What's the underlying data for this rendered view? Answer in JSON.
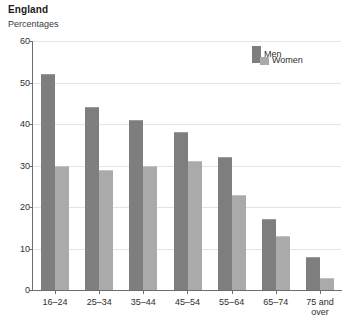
{
  "header": {
    "title": "England",
    "subtitle": "Percentages"
  },
  "legend": {
    "position": "top-right",
    "entries": [
      {
        "label": "Men",
        "color": "#7e7e7e"
      },
      {
        "label": "Women",
        "color": "#aaaaaa"
      }
    ]
  },
  "axes": {
    "y_ticks": [
      "0",
      "10",
      "20",
      "30",
      "40",
      "50",
      "60"
    ],
    "x_ticks": [
      "16–24",
      "25–34",
      "35–44",
      "45–54",
      "55–64",
      "65–74",
      "75 and\nover"
    ]
  },
  "chart_data": {
    "type": "bar",
    "title": "England",
    "subtitle": "Percentages",
    "xlabel": "",
    "ylabel": "Percentages",
    "ylim": [
      0,
      60
    ],
    "ytick_interval": 10,
    "grid": true,
    "legend_position": "top-right",
    "categories": [
      "16–24",
      "25–34",
      "35–44",
      "45–54",
      "55–64",
      "65–74",
      "75 and over"
    ],
    "series": [
      {
        "name": "Men",
        "color": "#7e7e7e",
        "values": [
          52,
          44,
          41,
          38,
          32,
          17,
          8
        ]
      },
      {
        "name": "Women",
        "color": "#aaaaaa",
        "values": [
          30,
          29,
          30,
          31,
          23,
          13,
          3
        ]
      }
    ]
  }
}
